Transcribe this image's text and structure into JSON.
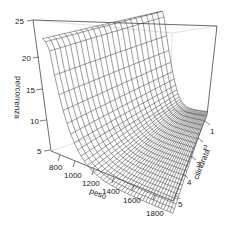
{
  "chart_data": {
    "type": "surface3d",
    "title": "",
    "axes": {
      "x": {
        "label": "peso",
        "ticks": [
          800,
          1000,
          1200,
          1400,
          1600,
          1800
        ],
        "range": [
          700,
          1850
        ]
      },
      "y": {
        "label": "cilindrata",
        "ticks": [
          1,
          2,
          3,
          4,
          5
        ],
        "range": [
          0.8,
          5
        ]
      },
      "z": {
        "label": "percorrenza",
        "ticks": [
          5,
          10,
          15,
          20,
          25
        ],
        "range": [
          5,
          25
        ]
      }
    },
    "grid": false,
    "box": true,
    "surface": {
      "description": "Wireframe surface: percorrenza is high (~20-23) at low peso and decreases steeply, flattening near 5-7 for peso above ~1200; nearly flat along cilindrata.",
      "samples": [
        {
          "peso": 750,
          "cilindrata": 1,
          "percorrenza": 23
        },
        {
          "peso": 750,
          "cilindrata": 5,
          "percorrenza": 20
        },
        {
          "peso": 1000,
          "cilindrata": 1,
          "percorrenza": 12
        },
        {
          "peso": 1200,
          "cilindrata": 1,
          "percorrenza": 8
        },
        {
          "peso": 1400,
          "cilindrata": 1,
          "percorrenza": 6.5
        },
        {
          "peso": 1800,
          "cilindrata": 1,
          "percorrenza": 6
        },
        {
          "peso": 1800,
          "cilindrata": 5,
          "percorrenza": 5
        }
      ],
      "mesh_color": "#222222"
    }
  },
  "labels": {
    "z_title": "percorrenza",
    "x_title": "peso",
    "y_title": "cilindrata",
    "z_ticks": [
      "25",
      "20",
      "15",
      "10",
      "5"
    ],
    "x_ticks": [
      "800",
      "1000",
      "1200",
      "1400",
      "1600",
      "1800"
    ],
    "y_ticks": [
      "1",
      "2",
      "3",
      "4",
      "5"
    ]
  }
}
